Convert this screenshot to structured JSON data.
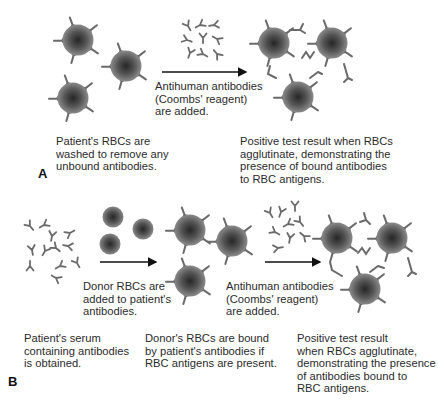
{
  "colors": {
    "cell_center": "#2e2e2e",
    "cell_edge": "#7a7a7a",
    "antibody": "#6e6e6e",
    "arrow": "#111111",
    "text": "#2b2b2b"
  },
  "panel_a": {
    "letter": "A",
    "step1_caption": "Patient's RBCs are\nwashed to remove any\nunbound antibodies.",
    "arrow_caption": "Antihuman antibodies\n(Coombs' reagent)\nare added.",
    "result_caption": "Positive test result when RBCs\nagglutinate, demonstrating the\npresence of bound antibodies\nto RBC antigens."
  },
  "panel_b": {
    "letter": "B",
    "step1_caption": "Patient's serum\ncontaining antibodies\nis obtained.",
    "arrow1_caption": "Donor RBCs are\nadded to patient's\nantibodies.",
    "step2_caption": "Donor's RBCs are bound\nby patient's antibodies if\nRBC antigens are present.",
    "arrow2_caption": "Antihuman antibodies\n(Coombs' reagent)\nare added.",
    "result_caption": "Positive test result\nwhen RBCs agglutinate,\ndemonstrating the presence\nof antibodies bound to\nRBC antigens."
  }
}
